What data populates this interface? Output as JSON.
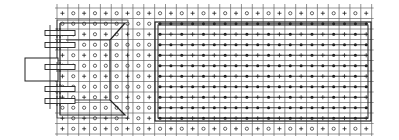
{
  "diagram": {
    "type": "grid-layout-schematic",
    "grid": {
      "x0": 57,
      "y0": 8,
      "cols": 29,
      "rows": 12,
      "cell_w": 10.85,
      "cell_h": 10.5,
      "line_color": "#555555",
      "edge_row_pattern": [
        "+",
        "o"
      ],
      "left_inner_pattern_rows": {
        "odd": [
          "o"
        ],
        "even": [
          "+",
          "o"
        ]
      },
      "right_inner_pattern_rows": {
        "dot_rows": "filled-dot",
        "plus_rows": [
          "+",
          "dot"
        ]
      }
    },
    "regions": [
      {
        "name": "left-trapezoid-region",
        "outer": [
          60,
          23,
          125,
          115
        ],
        "inner_line_x": 110,
        "inner_top": 40,
        "inner_bottom": 100
      },
      {
        "name": "right-array-region",
        "outer": [
          155,
          22,
          371,
          121
        ],
        "inner": [
          158,
          25,
          368,
          118
        ]
      }
    ],
    "connector": {
      "body": [
        25,
        58,
        58,
        81
      ],
      "pins_y": [
        33,
        45,
        67,
        89,
        101
      ],
      "pin_x": [
        45,
        75
      ]
    },
    "colors": {
      "ink": "#222222",
      "grid": "#666666",
      "background": "#ffffff"
    }
  }
}
